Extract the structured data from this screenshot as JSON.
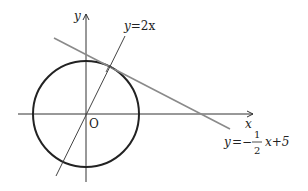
{
  "diagram": {
    "type": "coordinate-geometry",
    "axes": {
      "x_label": "x",
      "y_label": "y",
      "origin_label": "O"
    },
    "circle": {
      "center": "O",
      "description": "circle centered at origin tangent to line"
    },
    "lines": [
      {
        "id": "line-radius",
        "label": "y=2x",
        "label_parts": {
          "lhs": "y",
          "eq": "=",
          "rhs": "2x"
        }
      },
      {
        "id": "line-tangent",
        "label": "y=-1/2x+5",
        "label_parts": {
          "lhs": "y",
          "eq": "=−",
          "num": "1",
          "den": "2",
          "rest": "x+5"
        }
      }
    ],
    "marks": [
      "right-angle at tangent point"
    ],
    "colors": {
      "axis": "#333333",
      "circle": "#222222",
      "radius_line": "#444444",
      "tangent_line": "#888888",
      "text": "#222222"
    }
  }
}
